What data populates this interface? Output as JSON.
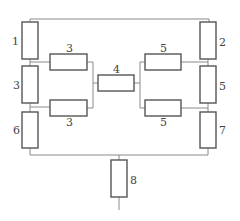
{
  "diagram": {
    "type": "resistor-network",
    "colors": {
      "wire": "#8a8a8a",
      "resistor_outline": "#555555",
      "label": "#444444",
      "background": "#ffffff"
    },
    "resistors": [
      {
        "id": "r1",
        "label": "1",
        "orientation": "vertical",
        "position": "left-top"
      },
      {
        "id": "r3-left",
        "label": "3",
        "orientation": "vertical",
        "position": "left-middle"
      },
      {
        "id": "r6",
        "label": "6",
        "orientation": "vertical",
        "position": "left-bottom"
      },
      {
        "id": "r3-upper",
        "label": "3",
        "orientation": "horizontal",
        "position": "center-left-upper"
      },
      {
        "id": "r3-lower",
        "label": "3",
        "orientation": "horizontal",
        "position": "center-left-lower"
      },
      {
        "id": "r4",
        "label": "4",
        "orientation": "horizontal",
        "position": "center"
      },
      {
        "id": "r5-upper",
        "label": "5",
        "orientation": "horizontal",
        "position": "center-right-upper"
      },
      {
        "id": "r5-lower",
        "label": "5",
        "orientation": "horizontal",
        "position": "center-right-lower"
      },
      {
        "id": "r2",
        "label": "2",
        "orientation": "vertical",
        "position": "right-top"
      },
      {
        "id": "r5-right",
        "label": "5",
        "orientation": "vertical",
        "position": "right-middle"
      },
      {
        "id": "r7",
        "label": "7",
        "orientation": "vertical",
        "position": "right-bottom"
      },
      {
        "id": "r8",
        "label": "8",
        "orientation": "vertical",
        "position": "bottom-center"
      }
    ]
  }
}
